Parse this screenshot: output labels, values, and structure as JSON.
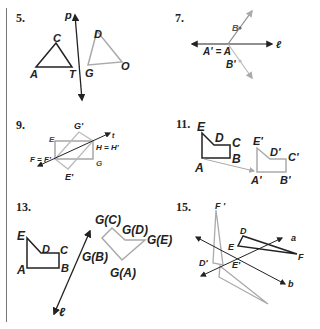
{
  "problems": [
    {
      "number": "5.",
      "labels": {
        "p": "p",
        "A": "A",
        "C": "C",
        "T": "T",
        "D": "D",
        "G": "G",
        "O": "O"
      }
    },
    {
      "number": "7.",
      "labels": {
        "B": "B",
        "A": "A' = A",
        "Bp": "B'",
        "l": "ℓ"
      }
    },
    {
      "number": "9.",
      "labels": {
        "E": "E",
        "Gp": "G'",
        "t": "t",
        "H": "H = H'",
        "F": "F = F'",
        "G": "G",
        "Ep": "E'"
      }
    },
    {
      "number": "11.",
      "labels": {
        "E": "E",
        "D": "D",
        "C": "C",
        "B": "B",
        "A": "A",
        "Ep": "E'",
        "Dp": "D'",
        "Cp": "C'",
        "Ap": "A'",
        "Bp": "B'"
      }
    },
    {
      "number": "13.",
      "labels": {
        "E": "E",
        "D": "D",
        "C": "C",
        "A": "A",
        "B": "B",
        "GC": "G(C)",
        "GD": "G(D)",
        "GE": "G(E)",
        "GB": "G(B)",
        "GA": "G(A)",
        "l": "ℓ"
      }
    },
    {
      "number": "15.",
      "labels": {
        "Fp": "F '",
        "D": "D",
        "a": "a",
        "E": "E",
        "F": "F",
        "Dp": "D'",
        "Ep": "E'",
        "b": "b"
      }
    }
  ],
  "colors": {
    "ink": "#222222",
    "image": "#a0a0a0"
  }
}
